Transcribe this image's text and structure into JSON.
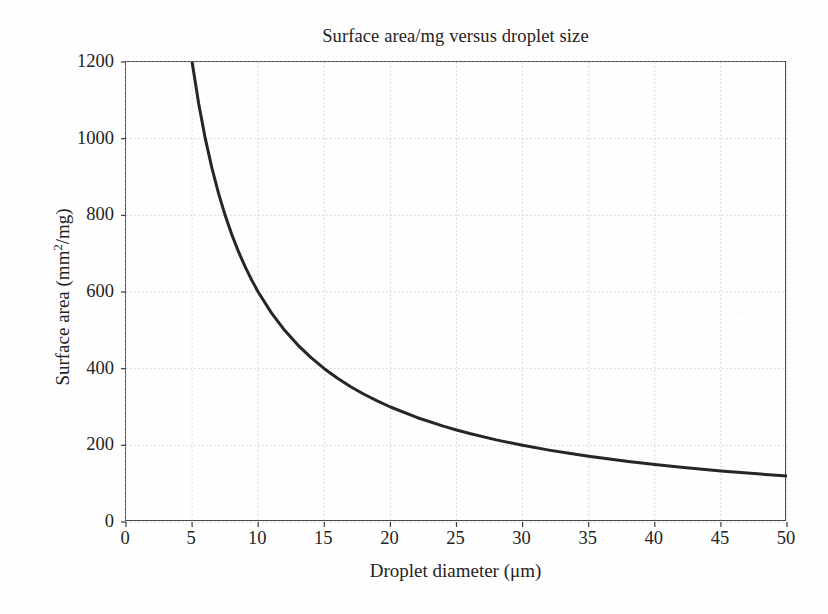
{
  "chart_data": {
    "type": "line",
    "title": "Surface area/mg versus droplet size",
    "xlabel": "Droplet diameter (μm)",
    "ylabel_prefix": "Surface area (mm",
    "ylabel_sup": "2",
    "ylabel_suffix": "/mg)",
    "ylabel_plain": "Surface area (mm2/mg)",
    "xlim": [
      0,
      50
    ],
    "ylim": [
      0,
      1200
    ],
    "xticks": [
      0,
      5,
      10,
      15,
      20,
      25,
      30,
      35,
      40,
      45,
      50
    ],
    "yticks": [
      0,
      200,
      400,
      600,
      800,
      1000,
      1200
    ],
    "grid": true,
    "grid_color": "#cfcfcf",
    "legend": null,
    "relation": "surface_area = 6000 / diameter",
    "series": [
      {
        "name": "Specific surface area",
        "color": "#262626",
        "linewidth": 3,
        "x": [
          5,
          5.5,
          6,
          6.5,
          7,
          7.5,
          8,
          8.5,
          9,
          9.5,
          10,
          11,
          12,
          13,
          14,
          15,
          16,
          17,
          18,
          19,
          20,
          22,
          24,
          25,
          26,
          28,
          30,
          32,
          34,
          35,
          36,
          38,
          40,
          42,
          44,
          45,
          46,
          48,
          50
        ],
        "y": [
          1200,
          1090.9,
          1000,
          923.1,
          857.1,
          800,
          750,
          705.9,
          666.7,
          631.6,
          600,
          545.5,
          500,
          461.5,
          428.6,
          400,
          375,
          352.9,
          333.3,
          315.8,
          300,
          272.7,
          250,
          240,
          230.8,
          214.3,
          200,
          187.5,
          176.5,
          171.4,
          166.7,
          157.9,
          150,
          142.9,
          136.4,
          133.3,
          130.4,
          125,
          120
        ]
      }
    ]
  },
  "chart_title": "Surface area/mg versus droplet size"
}
